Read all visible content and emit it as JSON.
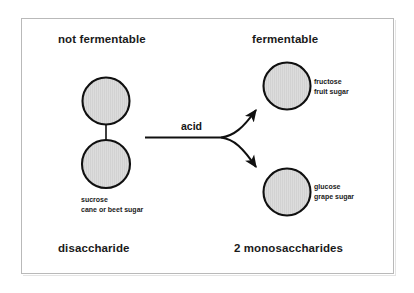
{
  "diagram": {
    "headers": {
      "left": "not fermentable",
      "right": "fermentable"
    },
    "footers": {
      "left": "disaccharide",
      "right": "2 monosaccharides"
    },
    "reaction": {
      "label": "acid"
    },
    "molecules": [
      {
        "id": "sucrose",
        "side": "left",
        "name": "sucrose",
        "common_name": "cane or beet sugar",
        "units": 2
      },
      {
        "id": "fructose",
        "side": "right",
        "name": "fructose",
        "common_name": "fruit sugar",
        "units": 1
      },
      {
        "id": "glucose",
        "side": "right",
        "name": "glucose",
        "common_name": "grape sugar",
        "units": 1
      }
    ]
  },
  "colors": {
    "circle_fill": "#d9d9d9",
    "circle_stroke": "#101010",
    "text": "#1a1a1a",
    "frame": "#b9b9b9",
    "background": "#ffffff"
  }
}
